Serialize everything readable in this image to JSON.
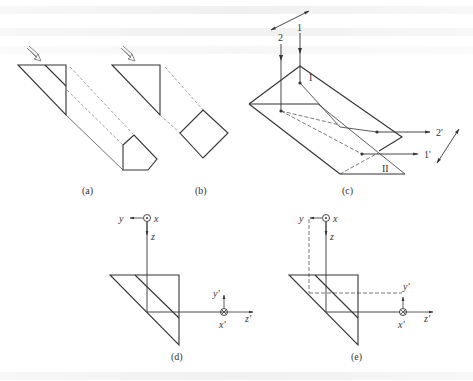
{
  "figure": {
    "panels": [
      {
        "id": "a",
        "caption": "(a)"
      },
      {
        "id": "b",
        "caption": "(b)"
      },
      {
        "id": "c",
        "caption": "(c)",
        "ray_labels": [
          "1",
          "2",
          "1'",
          "2'"
        ],
        "face_labels": [
          "I",
          "II"
        ]
      },
      {
        "id": "d",
        "caption": "(d)",
        "axes_in": {
          "y": "y",
          "x": "x",
          "z": "z"
        },
        "axes_out": {
          "y": "y'",
          "x": "x'",
          "z": "z'"
        }
      },
      {
        "id": "e",
        "caption": "(e)",
        "axes_in": {
          "y": "y",
          "x": "x",
          "z": "z"
        },
        "axes_out": {
          "y": "y'",
          "x": "x'",
          "z": "z'"
        }
      }
    ],
    "colors": {
      "line": "#333333",
      "dashed": "#777777",
      "arrow_hollow": "#888888"
    }
  }
}
